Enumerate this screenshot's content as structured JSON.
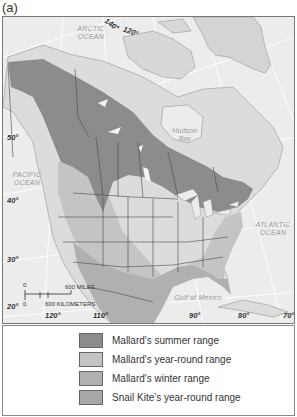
{
  "figure": {
    "panel_label": "(a)"
  },
  "map": {
    "ocean_labels": {
      "arctic": "ARCTIC\nOCEAN",
      "pacific": "PACIFIC\nOCEAN",
      "atlantic": "ATLANTIC\nOCEAN",
      "hudson": "Hudson\nBay",
      "gulf": "Gulf of Mexico"
    },
    "longitude_labels": [
      "140°",
      "120°",
      "120°",
      "110°",
      "90°",
      "80°",
      "70°"
    ],
    "latitude_labels": [
      "50°",
      "40°",
      "30°",
      "20°"
    ],
    "scale_bar": {
      "zero_top": "0",
      "miles": "600 MILES",
      "zero_bottom": "0",
      "kilometers": "600 KILOMETERS"
    },
    "colors": {
      "summer_range": "#8c8c8c",
      "year_round_range": "#c4c4c4",
      "winter_range": "#b0b0b0",
      "snail_kite_range": "#a8a8a8",
      "land": "#dcdcdc",
      "ocean": "#ececec",
      "borders": "#4a4a4a"
    }
  },
  "legend": {
    "items": [
      {
        "label": "Mallard's summer range",
        "color": "#8c8c8c"
      },
      {
        "label": "Mallard's year-round range",
        "color": "#c4c4c4"
      },
      {
        "label": "Mallard's winter range",
        "color": "#b0b0b0"
      },
      {
        "label": "Snail Kite's year-round range",
        "color": "#a8a8a8"
      }
    ]
  }
}
